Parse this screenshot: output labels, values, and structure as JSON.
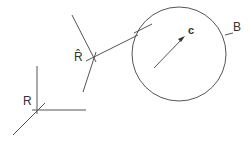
{
  "diagram": {
    "labels": {
      "frame_r": "R",
      "frame_r_hat": "R̂",
      "center": "c",
      "ball": "B"
    },
    "colors": {
      "line": "#555555",
      "text": "#333333",
      "background": "#ffffff"
    },
    "elements": {
      "frame_r": {
        "origin": [
          37,
          110
        ]
      },
      "frame_r_hat": {
        "origin": [
          93,
          57
        ]
      },
      "ball": {
        "center": [
          179,
          54
        ],
        "radius": 47
      },
      "center_point": [
        184,
        37
      ]
    }
  }
}
